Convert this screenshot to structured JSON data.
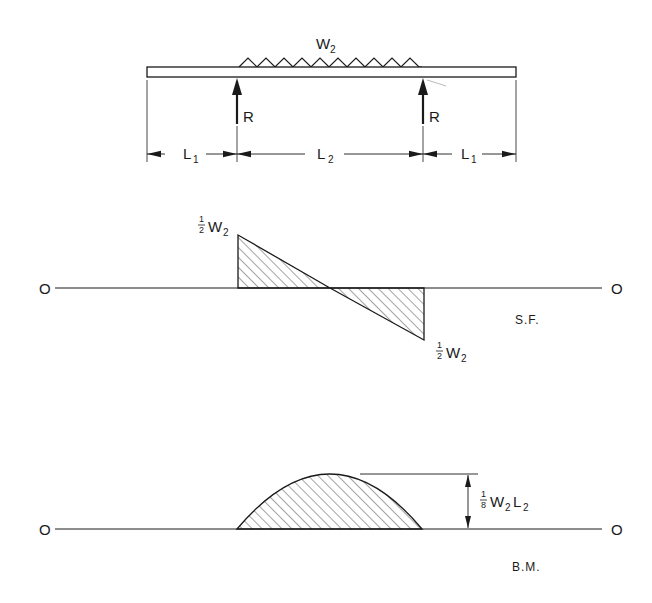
{
  "beam": {
    "load_label": "W",
    "load_sub": "2",
    "reaction_left": "R",
    "reaction_right": "R",
    "dims": [
      {
        "label": "L",
        "sub": "1"
      },
      {
        "label": "L",
        "sub": "2"
      },
      {
        "label": "L",
        "sub": "1"
      }
    ]
  },
  "shear_force": {
    "caption": "S.F.",
    "origin_left": "O",
    "origin_right": "O",
    "top_label": {
      "num": "1",
      "den": "2",
      "text": "W",
      "sub": "2"
    },
    "bottom_label": {
      "num": "1",
      "den": "2",
      "text": "W",
      "sub": "2"
    }
  },
  "bending_moment": {
    "caption": "B.M.",
    "origin_left": "O",
    "origin_right": "O",
    "peak_label": {
      "num": "1",
      "den": "8",
      "text1": "W",
      "sub1": "2",
      "text2": "L",
      "sub2": "2"
    }
  },
  "colors": {
    "ink": "#1a1a1a",
    "background": "#ffffff"
  }
}
